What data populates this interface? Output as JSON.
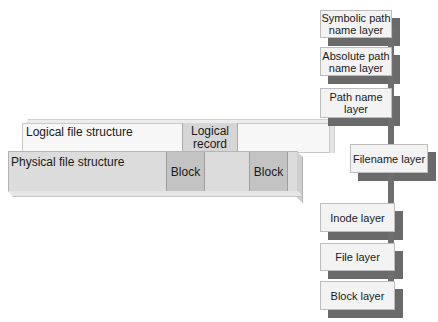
{
  "diagram": {
    "left": {
      "logical_structure_label": "Logical file structure",
      "logical_record_label": "Logical\nrecord",
      "logical_record_line1": "Logical",
      "logical_record_line2": "record",
      "physical_structure_label": "Physical file structure",
      "blocks": [
        "Block",
        "Block"
      ]
    },
    "layers": [
      {
        "id": "symbolic-path-name-layer",
        "line1": "Symbolic path",
        "line2": "name layer"
      },
      {
        "id": "absolute-path-name-layer",
        "line1": "Absolute path",
        "line2": "name layer"
      },
      {
        "id": "path-name-layer",
        "line1": "Path name",
        "line2": "layer"
      },
      {
        "id": "filename-layer",
        "line1": "Filename layer",
        "line2": ""
      },
      {
        "id": "inode-layer",
        "line1": "Inode layer",
        "line2": ""
      },
      {
        "id": "file-layer",
        "line1": "File layer",
        "line2": ""
      },
      {
        "id": "block-layer",
        "line1": "Block layer",
        "line2": ""
      }
    ],
    "colors": {
      "box_fill": "#f3f3f3",
      "shadow": "#6a6a6a",
      "connector": "#6e6e6e",
      "block_fill": "#c3c3c3",
      "physical_fill": "#dcdcdc",
      "logical_fill": "#f7f7f7"
    }
  }
}
